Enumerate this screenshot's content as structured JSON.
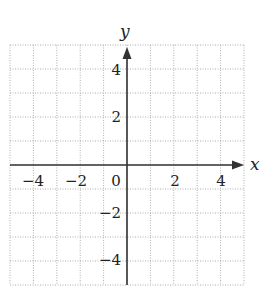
{
  "figure": {
    "type": "coordinate-grid",
    "x_axis_label": "x",
    "y_axis_label": "y",
    "x_range": [
      -5,
      5
    ],
    "y_range": [
      -5,
      5
    ],
    "grid_step": 1,
    "grid_style": "dotted",
    "x_tick_labels": [
      {
        "value": -4,
        "label": "−4"
      },
      {
        "value": -2,
        "label": "−2"
      },
      {
        "value": 0,
        "label": "0"
      },
      {
        "value": 2,
        "label": "2"
      },
      {
        "value": 4,
        "label": "4"
      }
    ],
    "y_tick_labels": [
      {
        "value": 4,
        "label": "4"
      },
      {
        "value": 2,
        "label": "2"
      },
      {
        "value": -2,
        "label": "−2"
      },
      {
        "value": -4,
        "label": "−4"
      }
    ],
    "colors": {
      "axis": "#333333",
      "grid": "#9a9a9a",
      "background": "#ffffff"
    }
  }
}
